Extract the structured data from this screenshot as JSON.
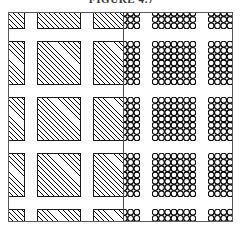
{
  "figure": {
    "caption": "FIGURE 4.7",
    "caption_visible_fragment": "FIGURE 4.7",
    "caption_clipped": "true"
  },
  "frame": {
    "outline_color": "#5a5a5a",
    "divider_color": "#4a4a4a",
    "background_color": "#ffffff",
    "width_px": 225,
    "height_px": 210
  },
  "panels": [
    {
      "id": "hatched",
      "name": "left-panel",
      "representation": "hatched-squares",
      "fill_style": "45-degree diagonal hatching",
      "outline_color": "#1a1a1a",
      "hatch_color": "#000000"
    },
    {
      "id": "circles",
      "name": "right-panel",
      "representation": "circle-clusters",
      "circle_outline_color": "#000000",
      "circle_fill_color": "#ffffff",
      "circles_per_cluster_side": 7
    }
  ],
  "lattice": {
    "rows": 4,
    "columns": 4,
    "pitch_px": 56,
    "cell_size_px": 44,
    "offset_x_px": -28,
    "offset_y_px": -28,
    "edge_cells_clipped": "true"
  },
  "chart_data": {
    "type": "diagram",
    "title": "FIGURE 4.7",
    "panels": [
      "hatched-squares",
      "circle-clusters"
    ],
    "grid_rows": 4,
    "grid_columns": 4,
    "cell_pitch": 56,
    "cell_size": 44
  }
}
